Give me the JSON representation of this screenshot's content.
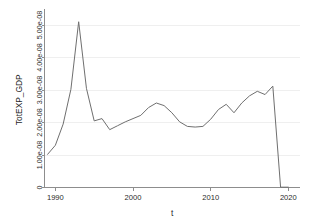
{
  "chart_data": {
    "type": "line",
    "title": "",
    "xlabel": "t",
    "ylabel": "TotEXP_GDP",
    "xlim": [
      1988.6,
      2021.5
    ],
    "ylim": [
      0,
      5.4e-08
    ],
    "grid": true,
    "legend": "none",
    "xticks": [
      1990,
      2000,
      2010,
      2020
    ],
    "xtick_labels": [
      "1990",
      "2000",
      "2010",
      "2020"
    ],
    "yticks": [
      0,
      1e-08,
      2e-08,
      3e-08,
      4e-08,
      5e-08
    ],
    "ytick_labels": [
      "0",
      "1.00e-08",
      "2.00e-08",
      "3.00e-08",
      "4.00e-08",
      "5.00e-08"
    ],
    "line_color": "#6f6f6f",
    "series": [
      {
        "name": "TotEXP_GDP",
        "x": [
          1989,
          1990,
          1991,
          1992,
          1993,
          1994,
          1995,
          1996,
          1997,
          1998,
          1999,
          2000,
          2001,
          2002,
          2003,
          2004,
          2005,
          2006,
          2007,
          2008,
          2009,
          2010,
          2011,
          2012,
          2013,
          2014,
          2015,
          2016,
          2017,
          2018,
          2019,
          2020
        ],
        "y": [
          1.02e-08,
          1.3e-08,
          1.95e-08,
          3.02e-08,
          5.1e-08,
          3.05e-08,
          2.05e-08,
          2.12e-08,
          1.78e-08,
          1.9e-08,
          2.02e-08,
          2.12e-08,
          2.22e-08,
          2.46e-08,
          2.6e-08,
          2.52e-08,
          2.3e-08,
          2.02e-08,
          1.88e-08,
          1.86e-08,
          1.88e-08,
          2.1e-08,
          2.4e-08,
          2.56e-08,
          2.3e-08,
          2.6e-08,
          2.82e-08,
          2.96e-08,
          2.86e-08,
          3.12e-08,
          1e-10,
          1e-10
        ]
      }
    ]
  },
  "axis": {
    "ylabel_text": "TotEXP_GDP",
    "xlabel_text": "t"
  }
}
